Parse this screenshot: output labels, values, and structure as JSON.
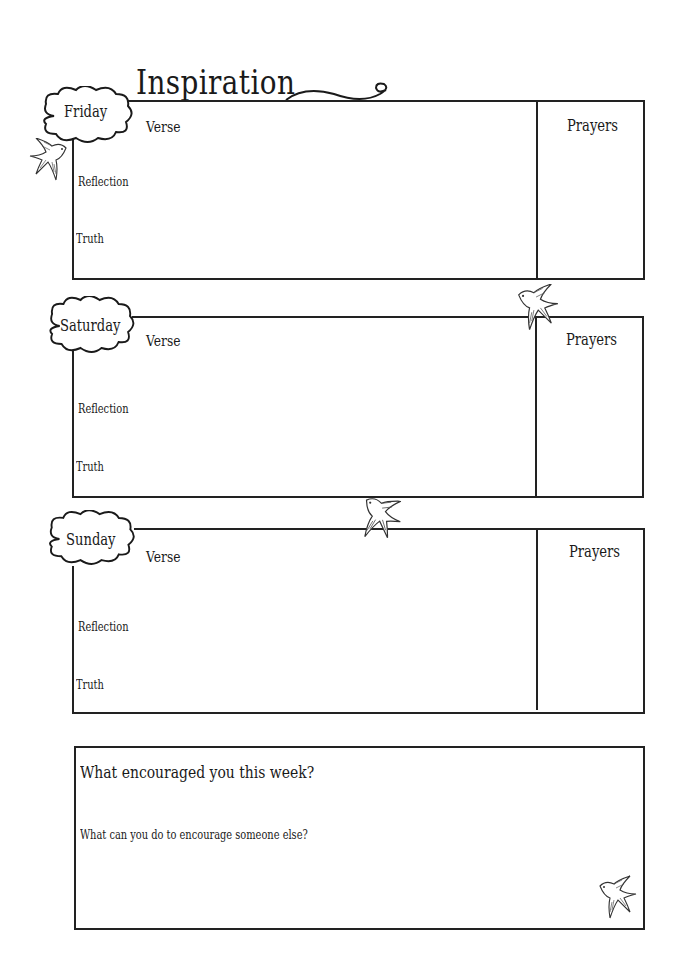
{
  "title": "Inspiration",
  "days": [
    {
      "name": "Friday",
      "verse": "Verse",
      "reflection": "Reflection",
      "truth": "Truth",
      "prayers": "Prayers"
    },
    {
      "name": "Saturday",
      "verse": "Verse",
      "reflection": "Reflection",
      "truth": "Truth",
      "prayers": "Prayers"
    },
    {
      "name": "Sunday",
      "verse": "Verse",
      "reflection": "Reflection",
      "truth": "Truth",
      "prayers": "Prayers"
    }
  ],
  "summary": {
    "question1": "What encouraged you this week?",
    "question2": "What can you do to encourage someone else?"
  },
  "decorations": {
    "icons": [
      "swirl-icon",
      "cloud-icon",
      "swallow-bird-icon"
    ],
    "line_color": "#222222"
  }
}
